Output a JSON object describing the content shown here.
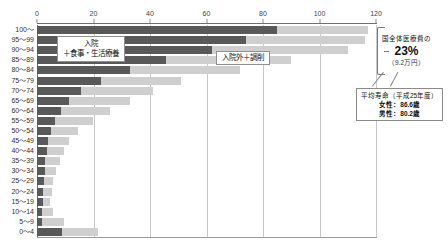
{
  "chart_data": {
    "type": "bar",
    "subtype": "stacked-horizontal",
    "title": "",
    "xlabel": "",
    "ylabel": "",
    "xlim": [
      0,
      120
    ],
    "xticks": [
      0,
      20,
      40,
      60,
      80,
      100,
      120
    ],
    "grid": true,
    "orientation": "horizontal",
    "legend_position": "inside-plot",
    "categories": [
      "100〜",
      "95〜99",
      "90〜94",
      "85〜89",
      "80〜84",
      "75〜79",
      "70〜74",
      "65〜69",
      "60〜64",
      "55〜59",
      "50〜54",
      "45〜49",
      "40〜44",
      "35〜39",
      "30〜34",
      "25〜29",
      "20〜24",
      "15〜19",
      "10〜14",
      "5〜9",
      "0〜4"
    ],
    "series": [
      {
        "name": "入院＋食事・生活療養",
        "color": "#595959",
        "values": [
          85.0,
          74.0,
          62.0,
          45.5,
          33.0,
          22.5,
          15.5,
          11.5,
          8.5,
          6.5,
          5.0,
          4.0,
          3.4,
          3.0,
          2.8,
          2.4,
          2.2,
          2.0,
          1.9,
          1.9,
          9.0
        ]
      },
      {
        "name": "入院外＋調削",
        "color": "#cfcfcf",
        "values": [
          32.0,
          42.0,
          48.0,
          44.5,
          39.0,
          28.5,
          25.5,
          21.5,
          17.5,
          13.5,
          9.5,
          7.5,
          6.0,
          5.0,
          4.0,
          3.4,
          3.0,
          2.6,
          3.6,
          7.5,
          12.5
        ]
      }
    ],
    "annotations": {
      "share_prefix": "国全体医療費の",
      "share_value": "23%",
      "share_sub": "（9.2万円）",
      "life_title": "平均寿命（平成25年度）",
      "life_female": "女性：86.6歳",
      "life_male": "男性：80.2歳"
    }
  },
  "legend": {
    "inpatient_line1": "入院",
    "inpatient_line2": "＋食事・生活療養",
    "outpatient": "入院外＋調削"
  },
  "colors": {
    "inpatient": "#595959",
    "outpatient": "#cfcfcf",
    "grid": "#c9c9c9",
    "axis": "#6f6f6f",
    "background": "#ffffff"
  }
}
